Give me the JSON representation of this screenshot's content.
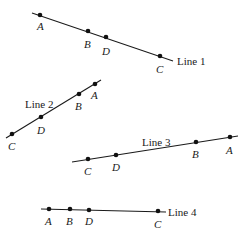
{
  "diagram": {
    "lines": [
      {
        "label": "Line 1",
        "start": [
          32,
          13
        ],
        "end": [
          173,
          61
        ],
        "label_pos": [
          177,
          65
        ],
        "points": [
          {
            "name": "A",
            "pos": [
              40,
              15
            ],
            "label_pos": [
              37,
              30
            ]
          },
          {
            "name": "B",
            "pos": [
              88,
              31
            ],
            "label_pos": [
              84,
              48
            ]
          },
          {
            "name": "D",
            "pos": [
              106,
              37
            ],
            "label_pos": [
              102,
              55
            ]
          },
          {
            "name": "C",
            "pos": [
              160,
              56
            ],
            "label_pos": [
              156,
              73
            ]
          }
        ]
      },
      {
        "label": "Line 2",
        "start": [
          6,
          138
        ],
        "end": [
          101,
          80
        ],
        "label_pos": [
          25,
          108
        ],
        "points": [
          {
            "name": "A",
            "pos": [
              95,
              84
            ],
            "label_pos": [
              91,
              99
            ]
          },
          {
            "name": "B",
            "pos": [
              79,
              94
            ],
            "label_pos": [
              75,
              110
            ]
          },
          {
            "name": "D",
            "pos": [
              41,
              117
            ],
            "label_pos": [
              37,
              134
            ]
          },
          {
            "name": "C",
            "pos": [
              12,
              134
            ],
            "label_pos": [
              8,
              150
            ]
          }
        ]
      },
      {
        "label": "Line 3",
        "start": [
          72,
          162
        ],
        "end": [
          238,
          136
        ],
        "label_pos": [
          142,
          146
        ],
        "points": [
          {
            "name": "A",
            "pos": [
              230,
              137
            ],
            "label_pos": [
              226,
              154
            ]
          },
          {
            "name": "B",
            "pos": [
              196,
              142
            ],
            "label_pos": [
              192,
              158
            ]
          },
          {
            "name": "D",
            "pos": [
              116,
              155
            ],
            "label_pos": [
              112,
              171
            ]
          },
          {
            "name": "C",
            "pos": [
              88,
              159
            ],
            "label_pos": [
              84,
              175
            ]
          }
        ]
      },
      {
        "label": "Line 4",
        "start": [
          41,
          209
        ],
        "end": [
          166,
          212
        ],
        "label_pos": [
          168,
          216
        ],
        "points": [
          {
            "name": "A",
            "pos": [
              49,
              209
            ],
            "label_pos": [
              45,
              225
            ]
          },
          {
            "name": "B",
            "pos": [
              70,
              209
            ],
            "label_pos": [
              66,
              225
            ]
          },
          {
            "name": "D",
            "pos": [
              89,
              210
            ],
            "label_pos": [
              85,
              225
            ]
          },
          {
            "name": "C",
            "pos": [
              158,
              211
            ],
            "label_pos": [
              154,
              228
            ]
          }
        ]
      }
    ]
  }
}
